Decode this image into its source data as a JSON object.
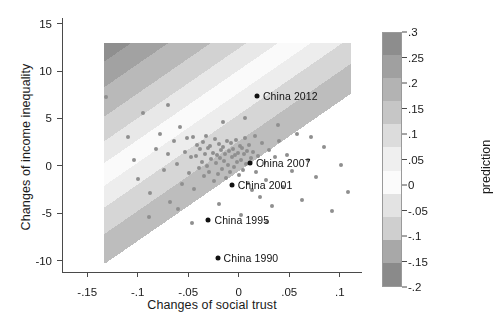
{
  "chart_data": {
    "type": "scatter",
    "title": "",
    "xlabel": "Changes of social trust",
    "ylabel": "Changes of income inequality",
    "xlim": [
      -0.175,
      0.122
    ],
    "ylim": [
      -11.2,
      15.6
    ],
    "xticks": [
      "-.15",
      "-.1",
      "-.05",
      "0",
      ".05",
      ".1"
    ],
    "xtickvals": [
      -0.15,
      -0.1,
      -0.05,
      0,
      0.05,
      0.1
    ],
    "yticks": [
      "-10",
      "-5",
      "0",
      "5",
      "10",
      "15"
    ],
    "ytickvals": [
      -10,
      -5,
      0,
      5,
      10,
      15
    ],
    "grid": false,
    "legend": {
      "position": "right",
      "title": "prediction",
      "type": "colorbar",
      "ticks": [
        ".3",
        ".25",
        ".2",
        ".15",
        ".1",
        ".05",
        "0",
        "-.05",
        "-.1",
        "-.15",
        "-.2"
      ],
      "tickvals": [
        0.3,
        0.25,
        0.2,
        0.15,
        0.1,
        0.05,
        0,
        -0.05,
        -0.1,
        -0.15,
        -0.2
      ],
      "vmin": -0.2,
      "vmax": 0.3,
      "colors": [
        "#8d8d8d",
        "#a0a0a0",
        "#b3b3b3",
        "#c6c6c6",
        "#dcdcdc",
        "#efefef",
        "#fbfbfb",
        "#e3e3e3",
        "#cfcfcf",
        "#a8a8a8",
        "#8a8a8a"
      ]
    },
    "surface": {
      "description": "contour bands of predicted value, sloping upward to the right",
      "xrange": [
        -0.133,
        0.112
      ],
      "yrange": [
        -10.2,
        13.0
      ],
      "band_edges_left": [
        13.0,
        11.0,
        8.3,
        5.2,
        2.6,
        0.3,
        -2.1,
        -4.4,
        -7.2,
        -10.2
      ],
      "band_slope": 18.0,
      "band_colors": [
        "#8f8f8f",
        "#a2a2a2",
        "#b9b9b9",
        "#d2d2d2",
        "#e8e8e8",
        "#fafafa",
        "#ededed",
        "#d6d6d6",
        "#bdbdbd",
        "#ababab"
      ]
    },
    "highlighted": [
      {
        "label": "China 2012",
        "x": 0.018,
        "y": 7.4
      },
      {
        "label": "China 2007",
        "x": 0.011,
        "y": 0.3
      },
      {
        "label": "China 2001",
        "x": -0.007,
        "y": -2.0
      },
      {
        "label": "China 1995",
        "x": -0.03,
        "y": -5.7
      },
      {
        "label": "China 1990",
        "x": -0.021,
        "y": -9.7
      }
    ],
    "points": [
      {
        "x": -0.131,
        "y": 7.3
      },
      {
        "x": -0.104,
        "y": 0.6
      },
      {
        "x": -0.1,
        "y": -1.4
      },
      {
        "x": -0.095,
        "y": 5.6
      },
      {
        "x": -0.088,
        "y": -2.9
      },
      {
        "x": -0.082,
        "y": 1.8
      },
      {
        "x": -0.078,
        "y": 3.4
      },
      {
        "x": -0.074,
        "y": -0.4
      },
      {
        "x": -0.07,
        "y": 1.2
      },
      {
        "x": -0.068,
        "y": -3.8
      },
      {
        "x": -0.064,
        "y": 2.6
      },
      {
        "x": -0.061,
        "y": 0.2
      },
      {
        "x": -0.058,
        "y": 4.1
      },
      {
        "x": -0.056,
        "y": -1.9
      },
      {
        "x": -0.053,
        "y": 1.5
      },
      {
        "x": -0.051,
        "y": 2.9
      },
      {
        "x": -0.049,
        "y": -0.8
      },
      {
        "x": -0.047,
        "y": 0.9
      },
      {
        "x": -0.045,
        "y": 3.0
      },
      {
        "x": -0.044,
        "y": -2.4
      },
      {
        "x": -0.042,
        "y": 1.0
      },
      {
        "x": -0.041,
        "y": 2.2
      },
      {
        "x": -0.039,
        "y": -0.2
      },
      {
        "x": -0.038,
        "y": 1.8
      },
      {
        "x": -0.036,
        "y": 0.4
      },
      {
        "x": -0.035,
        "y": 2.5
      },
      {
        "x": -0.034,
        "y": -1.1
      },
      {
        "x": -0.033,
        "y": 1.3
      },
      {
        "x": -0.032,
        "y": 3.2
      },
      {
        "x": -0.031,
        "y": 0.0
      },
      {
        "x": -0.03,
        "y": 1.9
      },
      {
        "x": -0.029,
        "y": -0.6
      },
      {
        "x": -0.028,
        "y": 2.1
      },
      {
        "x": -0.027,
        "y": 0.7
      },
      {
        "x": -0.026,
        "y": 1.4
      },
      {
        "x": -0.025,
        "y": -1.6
      },
      {
        "x": -0.024,
        "y": 2.8
      },
      {
        "x": -0.023,
        "y": 0.3
      },
      {
        "x": -0.022,
        "y": 1.1
      },
      {
        "x": -0.021,
        "y": -0.9
      },
      {
        "x": -0.02,
        "y": 2.3
      },
      {
        "x": -0.019,
        "y": 0.8
      },
      {
        "x": -0.018,
        "y": 1.7
      },
      {
        "x": -0.017,
        "y": -0.3
      },
      {
        "x": -0.016,
        "y": 2.0
      },
      {
        "x": -0.015,
        "y": 0.5
      },
      {
        "x": -0.014,
        "y": 1.2
      },
      {
        "x": -0.013,
        "y": -1.3
      },
      {
        "x": -0.012,
        "y": 2.6
      },
      {
        "x": -0.011,
        "y": 0.1
      },
      {
        "x": -0.01,
        "y": 1.6
      },
      {
        "x": -0.009,
        "y": -0.7
      },
      {
        "x": -0.008,
        "y": 2.4
      },
      {
        "x": -0.007,
        "y": 0.9
      },
      {
        "x": -0.006,
        "y": 1.8
      },
      {
        "x": -0.005,
        "y": -0.1
      },
      {
        "x": -0.004,
        "y": 1.1
      },
      {
        "x": -0.003,
        "y": 2.7
      },
      {
        "x": -0.002,
        "y": 0.4
      },
      {
        "x": -0.001,
        "y": 1.4
      },
      {
        "x": 0.0,
        "y": -1.0
      },
      {
        "x": 0.001,
        "y": 2.1
      },
      {
        "x": 0.002,
        "y": 0.6
      },
      {
        "x": 0.003,
        "y": 1.9
      },
      {
        "x": 0.004,
        "y": -0.4
      },
      {
        "x": 0.005,
        "y": 1.3
      },
      {
        "x": 0.006,
        "y": 2.9
      },
      {
        "x": 0.007,
        "y": 0.2
      },
      {
        "x": 0.008,
        "y": 1.6
      },
      {
        "x": 0.009,
        "y": -1.8
      },
      {
        "x": 0.01,
        "y": 2.2
      },
      {
        "x": 0.012,
        "y": 0.8
      },
      {
        "x": 0.013,
        "y": -2.6
      },
      {
        "x": 0.014,
        "y": 1.5
      },
      {
        "x": 0.016,
        "y": 3.1
      },
      {
        "x": 0.017,
        "y": -0.6
      },
      {
        "x": 0.019,
        "y": 1.0
      },
      {
        "x": 0.021,
        "y": -3.3
      },
      {
        "x": 0.023,
        "y": 2.4
      },
      {
        "x": 0.025,
        "y": 0.3
      },
      {
        "x": 0.027,
        "y": -1.5
      },
      {
        "x": 0.03,
        "y": 1.7
      },
      {
        "x": 0.033,
        "y": -4.2
      },
      {
        "x": 0.036,
        "y": 0.9
      },
      {
        "x": 0.04,
        "y": 2.6
      },
      {
        "x": 0.044,
        "y": -2.2
      },
      {
        "x": 0.048,
        "y": 1.1
      },
      {
        "x": 0.053,
        "y": -0.5
      },
      {
        "x": 0.058,
        "y": 3.4
      },
      {
        "x": 0.063,
        "y": -3.6
      },
      {
        "x": 0.069,
        "y": 0.6
      },
      {
        "x": 0.076,
        "y": -1.2
      },
      {
        "x": 0.084,
        "y": 2.0
      },
      {
        "x": 0.092,
        "y": -4.8
      },
      {
        "x": 0.101,
        "y": 0.1
      },
      {
        "x": 0.108,
        "y": -2.8
      },
      {
        "x": -0.089,
        "y": -5.4
      },
      {
        "x": -0.06,
        "y": -4.6
      },
      {
        "x": -0.046,
        "y": -6.0
      },
      {
        "x": -0.02,
        "y": -4.0
      },
      {
        "x": 0.002,
        "y": -5.2
      },
      {
        "x": 0.028,
        "y": -5.9
      },
      {
        "x": -0.07,
        "y": 6.4
      },
      {
        "x": -0.016,
        "y": 4.6
      },
      {
        "x": 0.006,
        "y": 5.0
      },
      {
        "x": 0.039,
        "y": 4.3
      },
      {
        "x": -0.11,
        "y": 3.0
      },
      {
        "x": 0.072,
        "y": 3.0
      }
    ]
  }
}
